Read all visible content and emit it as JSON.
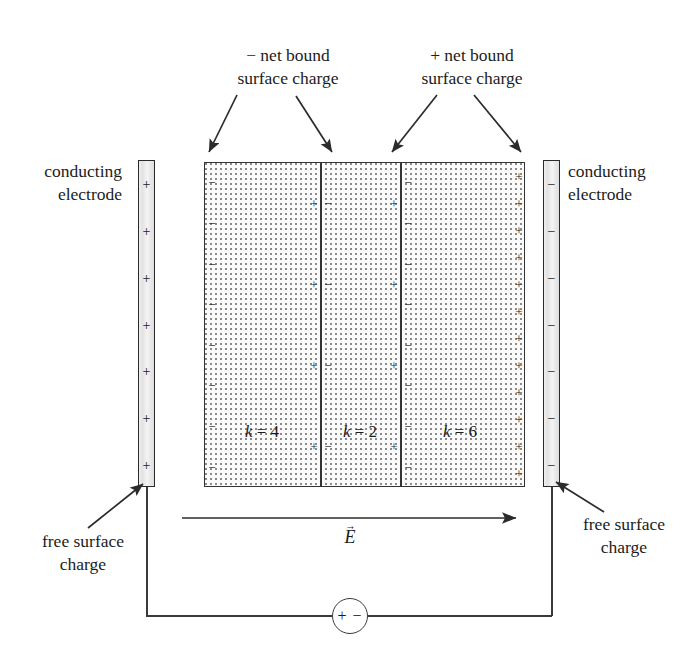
{
  "figure": {
    "background_color": "#ffffff",
    "ink_color": "#1c1c1c"
  },
  "annotations": {
    "neg_bound": {
      "line1": "− net bound",
      "line2": "surface charge"
    },
    "pos_bound": {
      "line1": "+ net bound",
      "line2": "surface charge"
    },
    "left_electrode": {
      "line1": "conducting",
      "line2": "electrode"
    },
    "right_electrode": {
      "line1": "conducting",
      "line2": "electrode"
    },
    "left_free_charge": {
      "line1": "free surface",
      "line2": "charge"
    },
    "right_free_charge": {
      "line1": "free surface",
      "line2": "charge"
    }
  },
  "electrodes": {
    "left": {
      "sign": "+",
      "charge_count": 7,
      "fill": "#e8e8e8",
      "border": "#2a2a2a"
    },
    "right": {
      "sign": "−",
      "charge_count": 7,
      "fill": "#e8e8e8",
      "border": "#2a2a2a"
    }
  },
  "dielectric": {
    "fill": "#fbfbfb",
    "border": "#333333",
    "regions": [
      {
        "name": "region-k4",
        "symbol": "k",
        "equals": " = ",
        "value": "4",
        "label": "k = 4",
        "left_sign": "−",
        "right_sign": "+",
        "left_count": 8,
        "right_count": 4
      },
      {
        "name": "region-k2",
        "symbol": "k",
        "equals": " = ",
        "value": "2",
        "label": "k = 2",
        "left_sign": "−",
        "right_sign": "+",
        "left_count": 4,
        "right_count": 4
      },
      {
        "name": "region-k6",
        "symbol": "k",
        "equals": " = ",
        "value": "6",
        "label": "k = 6",
        "left_sign": "−",
        "right_sign": "+",
        "left_count": 8,
        "right_count": 12
      }
    ]
  },
  "field": {
    "symbol": "E",
    "label": "E",
    "direction": "left-to-right"
  },
  "source": {
    "positive_terminal": "+",
    "negative_terminal": "−",
    "symbol": "+ −"
  }
}
